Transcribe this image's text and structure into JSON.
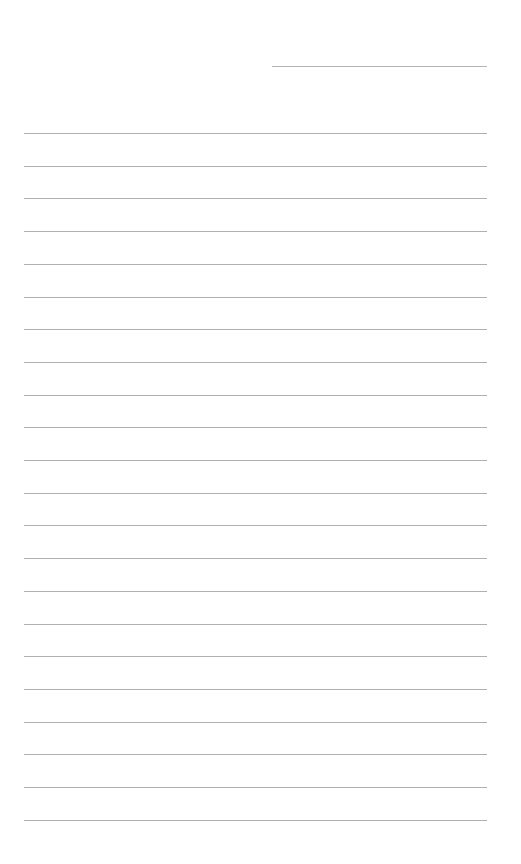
{
  "page": {
    "type": "lined-paper",
    "background": "#ffffff",
    "line_color": "#b0b0b0"
  },
  "header_field": {
    "label": "",
    "value": ""
  },
  "lines": {
    "count": 22,
    "first_y": 133,
    "spacing": 32.7,
    "left": 24,
    "right": 487
  }
}
